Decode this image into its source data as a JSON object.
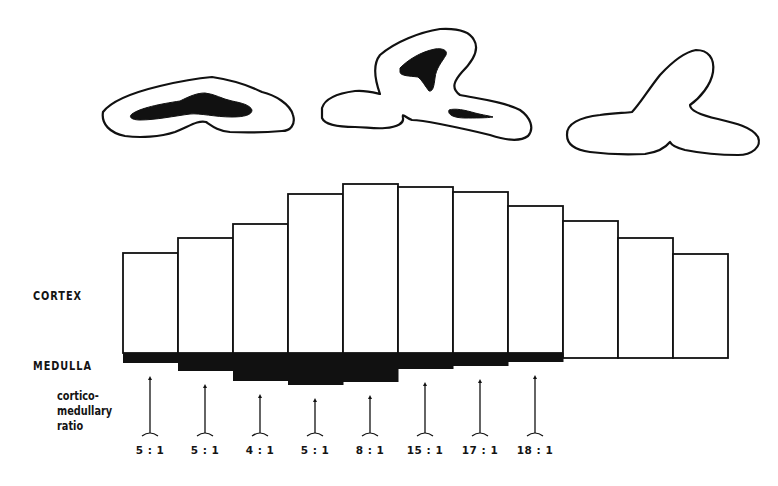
{
  "labels": {
    "cortex": "CORTEX",
    "medulla": "MEDULLA",
    "ratio_line1": "cortico-",
    "ratio_line2": "medullary",
    "ratio_line3": "ratio"
  },
  "colors": {
    "ink": "#111111",
    "paper": "#ffffff"
  },
  "kidney_sections": [
    {
      "name": "section-flat",
      "has_medulla": true
    },
    {
      "name": "section-lobed",
      "has_medulla": true
    },
    {
      "name": "section-no-medulla",
      "has_medulla": false
    }
  ],
  "chart_data": {
    "type": "bar",
    "title": "",
    "xlabel": "",
    "ylabel": "",
    "categories": [
      "1",
      "2",
      "3",
      "4",
      "5",
      "6",
      "7",
      "8",
      "9",
      "10",
      "11"
    ],
    "series": [
      {
        "name": "CORTEX",
        "values": [
          100,
          115,
          129,
          159,
          169,
          166,
          161,
          147,
          137,
          120,
          104
        ],
        "unit": "px height above baseline"
      },
      {
        "name": "MEDULLA",
        "values": [
          10,
          18,
          28,
          32,
          29,
          16,
          13,
          9,
          0,
          0,
          0
        ],
        "unit": "px depth below baseline"
      }
    ],
    "ratios": [
      {
        "column": 1,
        "label": "5 : 1"
      },
      {
        "column": 2,
        "label": "5 : 1"
      },
      {
        "column": 3,
        "label": "4 : 1"
      },
      {
        "column": 4,
        "label": "5 : 1"
      },
      {
        "column": 5,
        "label": "8 : 1"
      },
      {
        "column": 6,
        "label": "15 : 1"
      },
      {
        "column": 7,
        "label": "17 : 1"
      },
      {
        "column": 8,
        "label": "18 : 1"
      }
    ],
    "grid": false,
    "legend": "left side labels CORTEX / MEDULLA"
  }
}
